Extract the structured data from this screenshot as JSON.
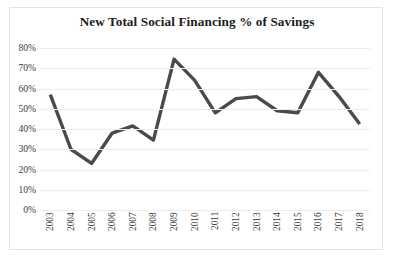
{
  "chart_data": {
    "type": "line",
    "title": "New Total Social Financing % of Savings",
    "xlabel": "",
    "ylabel": "",
    "categories": [
      "2003",
      "2004",
      "2005",
      "2006",
      "2007",
      "2008",
      "2009",
      "2010",
      "2011",
      "2012",
      "2013",
      "2014",
      "2015",
      "2016",
      "2017",
      "2018"
    ],
    "values": [
      57,
      30,
      23,
      38,
      41.5,
      34.5,
      74.5,
      64,
      48,
      55,
      56,
      49,
      48,
      68,
      56,
      42.5
    ],
    "series": [
      {
        "name": "New Total Social Financing % of Savings",
        "values": [
          57,
          30,
          23,
          38,
          41.5,
          34.5,
          74.5,
          64,
          48,
          55,
          56,
          49,
          48,
          68,
          56,
          42.5
        ]
      }
    ],
    "ylim": [
      0,
      80
    ],
    "ytick_labels": [
      "80%",
      "70%",
      "60%",
      "50%",
      "40%",
      "30%",
      "20%",
      "10%",
      "0%"
    ],
    "ytick_values": [
      80,
      70,
      60,
      50,
      40,
      30,
      20,
      10,
      0
    ],
    "grid": true,
    "legend": "none",
    "line_color": "#4a4a4a",
    "gridline_color": "#ededed",
    "frame_color": "#e2e2e2",
    "background_color": "#ffffff",
    "text_color": "#3b3b3b",
    "title_color": "#1c1c1c"
  }
}
